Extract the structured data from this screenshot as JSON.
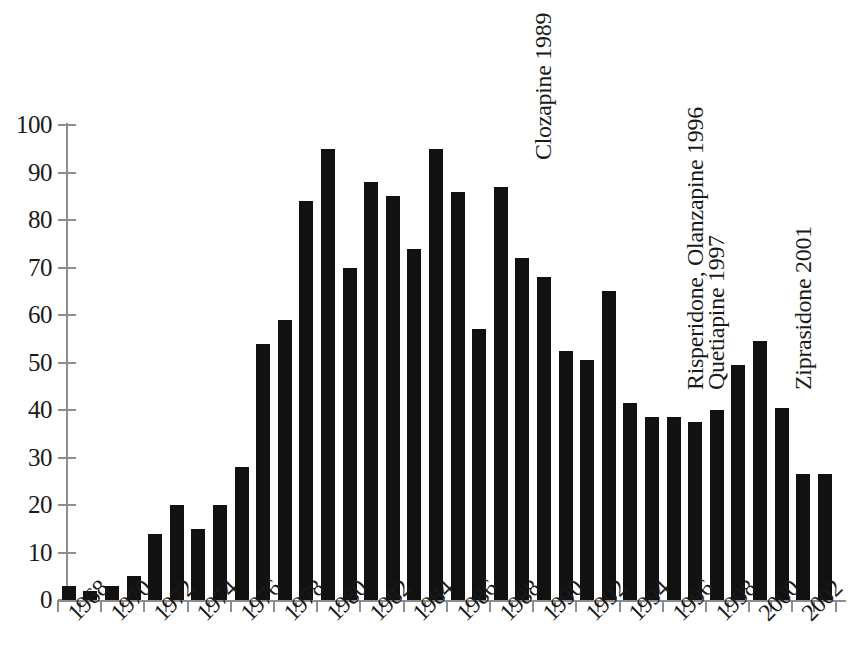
{
  "chart_data": {
    "type": "bar",
    "title": "",
    "subtitle": "",
    "xlabel": "",
    "ylabel": "",
    "ylim": [
      0,
      100
    ],
    "xlim_years": [
      1968,
      2003
    ],
    "grid": false,
    "legend": "none",
    "bar_color": "#111111",
    "axis_color": "#8d8d8d",
    "y_ticks": [
      0,
      10,
      20,
      30,
      40,
      50,
      60,
      70,
      80,
      90,
      100
    ],
    "y_tick_labels": [
      "0",
      "10",
      "20",
      "30",
      "40",
      "50",
      "60",
      "70",
      "80",
      "90",
      "100"
    ],
    "x_tick_labels": [
      "1968",
      "1970",
      "1972",
      "1974",
      "1976",
      "1978",
      "1980",
      "1982",
      "1984",
      "1986",
      "1988",
      "1990",
      "1992",
      "1994",
      "1996",
      "1998",
      "2000",
      "2002"
    ],
    "categories": [
      "1968",
      "1969",
      "1970",
      "1971",
      "1972",
      "1973",
      "1974",
      "1975",
      "1976",
      "1977",
      "1978",
      "1979",
      "1980",
      "1981",
      "1982",
      "1983",
      "1984",
      "1985",
      "1986",
      "1987",
      "1988",
      "1989",
      "1990",
      "1991",
      "1992",
      "1993",
      "1994",
      "1995",
      "1996",
      "1997",
      "1998",
      "1999",
      "2000",
      "2001",
      "2002",
      "2003"
    ],
    "values": [
      3,
      2,
      3,
      5,
      14,
      20,
      15,
      20,
      28,
      54,
      59,
      84,
      95,
      70,
      88,
      85,
      74,
      95,
      86,
      57,
      87,
      72,
      68,
      52.5,
      50.5,
      65,
      41.5,
      38.5,
      38.5,
      37.5,
      40,
      49.5,
      54.5,
      40.5,
      26.5,
      26.5
    ],
    "annotations": [
      {
        "text": "Clozapine 1989",
        "year": 1989,
        "rotation": -90
      },
      {
        "text": "Risperidone, Olanzapine 1996",
        "year": 1996,
        "rotation": -90
      },
      {
        "text": "Quetiapine 1997",
        "year": 1997,
        "rotation": -90
      },
      {
        "text": "Ziprasidone 2001",
        "year": 2001,
        "rotation": -90
      }
    ]
  }
}
